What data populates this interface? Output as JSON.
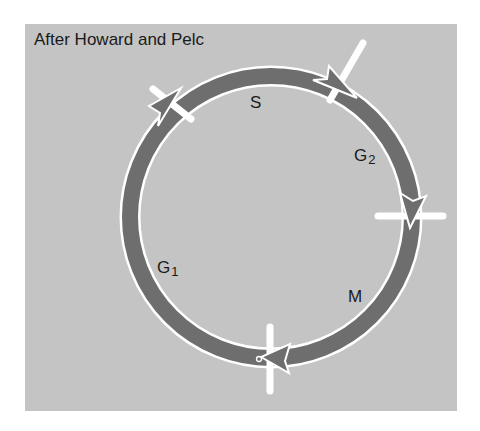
{
  "figure": {
    "caption": "After Howard and Pelc",
    "colors": {
      "background": "#c4c4c4",
      "ring": "#6e6e6e",
      "outline": "#ffffff",
      "text": "#1a1a1a"
    }
  },
  "cycle": {
    "direction": "clockwise",
    "phases": [
      {
        "id": "s",
        "label": "S",
        "sub": ""
      },
      {
        "id": "g2",
        "label": "G",
        "sub": "2"
      },
      {
        "id": "m",
        "label": "M",
        "sub": ""
      },
      {
        "id": "g1",
        "label": "G",
        "sub": "1"
      }
    ],
    "boundaries": [
      "G1/S",
      "S/G2",
      "G2/M",
      "M/G1"
    ]
  }
}
